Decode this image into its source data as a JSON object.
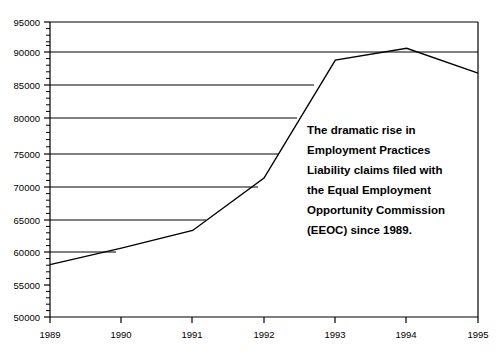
{
  "chart_data": {
    "type": "line",
    "title": "",
    "subtitle": "",
    "xlabel": "",
    "ylabel": "",
    "categories": [
      "1989",
      "1990",
      "1991",
      "1992",
      "1993",
      "1994",
      "1995"
    ],
    "x": [
      1989,
      1990,
      1991,
      1992,
      1993,
      1994,
      1995
    ],
    "values": [
      58000,
      60500,
      63200,
      71200,
      89200,
      91000,
      87200
    ],
    "series": [
      {
        "name": "EEOC claims filed",
        "values": [
          58000,
          60500,
          63200,
          71200,
          89200,
          91000,
          87200
        ],
        "color": "#000000"
      }
    ],
    "xlim": [
      1989,
      1995
    ],
    "ylim": [
      50000,
      95000
    ],
    "ytick_labels": [
      "95000",
      "90000",
      "85000",
      "80000",
      "75000",
      "70000",
      "65000",
      "60000",
      "55000",
      "50000"
    ],
    "ytick_values": [
      95000,
      90000,
      85000,
      80000,
      75000,
      70000,
      65000,
      60000,
      55000,
      50000
    ],
    "ytick_minor_step": 1000,
    "xtick_labels": [
      "1989",
      "1990",
      "1991",
      "1992",
      "1993",
      "1994",
      "1995"
    ],
    "grid": "horizontal-major-clipped-to-curve",
    "legend": "none",
    "legend_position": "none",
    "annotations": [
      {
        "name": "callout-text",
        "lines": [
          "The dramatic rise in",
          "Employment Practices",
          "Liability claims filed with",
          "the Equal Employment",
          "Opportunity Commission",
          "(EEOC) since 1989."
        ],
        "text": "The dramatic rise in Employment Practices Liability claims filed with the Equal Employment Opportunity Commission (EEOC) since 1989."
      }
    ]
  },
  "annotation": {
    "line_1": "The dramatic rise in",
    "line_2": "Employment Practices",
    "line_3": "Liability claims filed with",
    "line_4": "the Equal Employment",
    "line_5": "Opportunity Commission",
    "line_6": "(EEOC) since 1989."
  },
  "axis": {
    "y_labels": {
      "l0": "95000",
      "l1": "90000",
      "l2": "85000",
      "l3": "80000",
      "l4": "75000",
      "l5": "70000",
      "l6": "65000",
      "l7": "60000",
      "l8": "55000",
      "l9": "50000"
    },
    "x_labels": {
      "t0": "1989",
      "t1": "1990",
      "t2": "1991",
      "t3": "1992",
      "t4": "1993",
      "t5": "1994",
      "t6": "1995"
    }
  },
  "colors": {
    "background": "#ffffff",
    "ink": "#000000",
    "grid": "#000000",
    "series": "#000000"
  }
}
